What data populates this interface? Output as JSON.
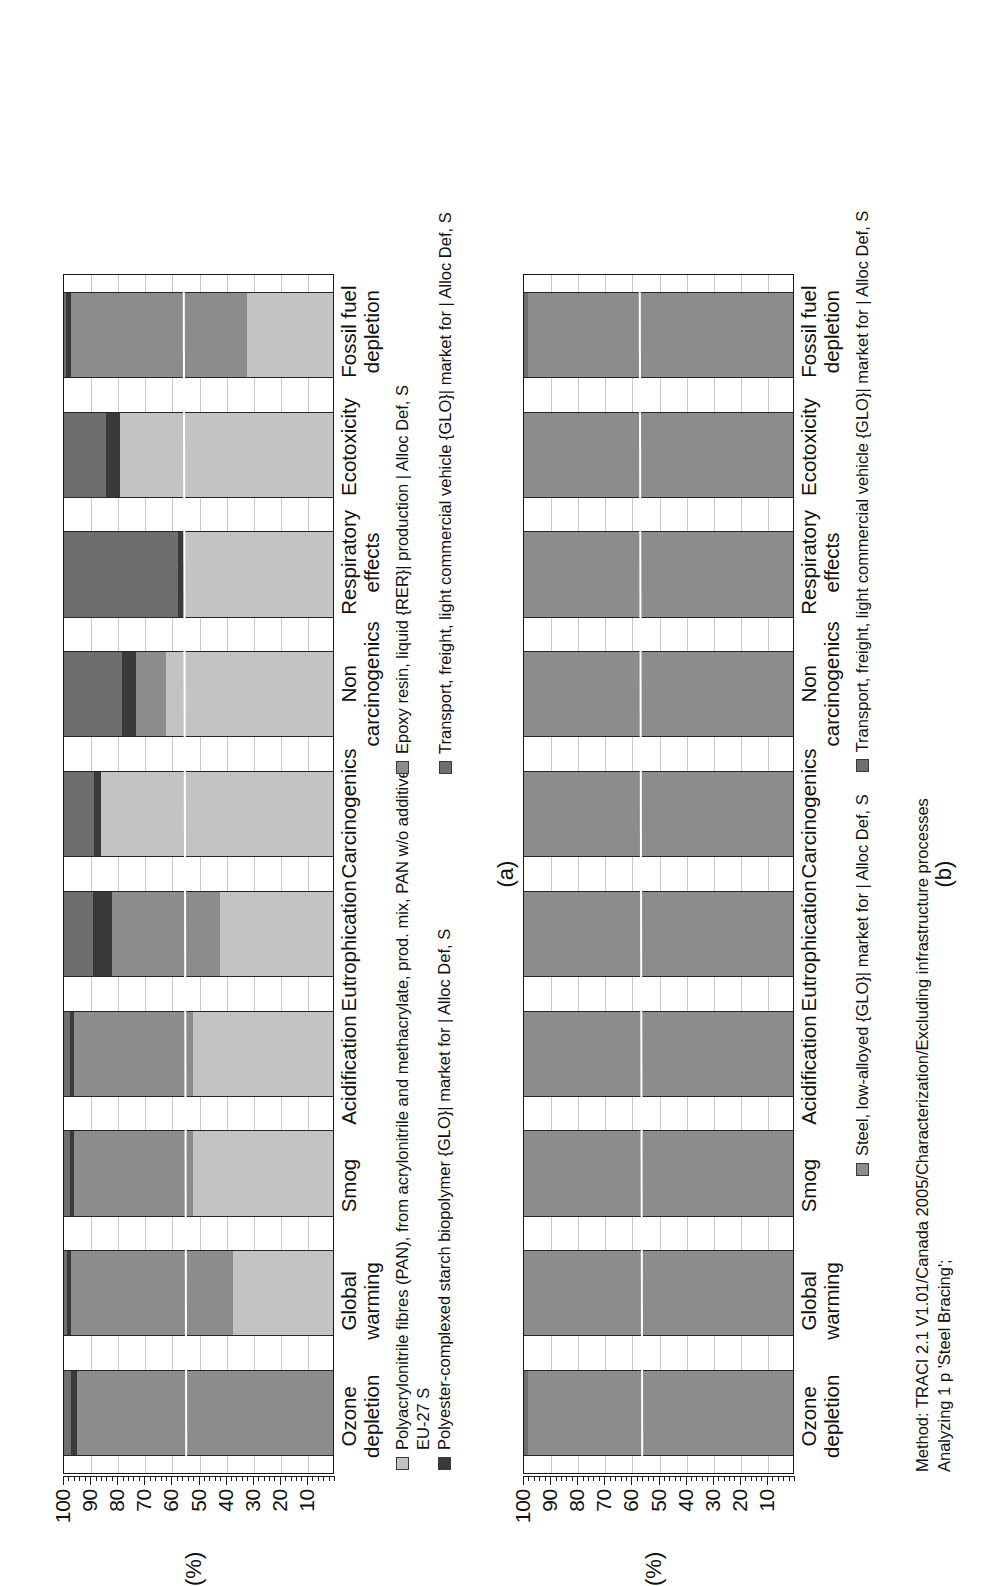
{
  "figure": {
    "axis_title": "(%)",
    "captions": {
      "a": "(a)",
      "b": "(b)"
    },
    "method_note": "Method: TRACI 2.1 V1.01/Canada 2005/Characterization/Excluding infrastructure processes\nAnalyzing 1 p 'Steel Bracing';"
  },
  "colors": {
    "light_gray": "#c3c3c3",
    "medium_gray": "#8c8c8c",
    "dark_gray": "#6e6e6e",
    "near_black": "#3a3a3a",
    "outline": "#262626",
    "grid": "#c9c9c9",
    "axis": "#1a1a1a"
  },
  "axis": {
    "ticks": [
      100,
      90,
      80,
      70,
      60,
      50,
      40,
      30,
      20,
      10
    ],
    "min": 0,
    "max": 100,
    "minor_per_major": 5
  },
  "chart_data": [
    {
      "id": "a",
      "type": "bar",
      "stacked": true,
      "orientation": "vertical",
      "title": "",
      "xlabel": "",
      "ylabel": "(%)",
      "ylim": [
        0,
        100
      ],
      "grid": true,
      "legend_position": "below",
      "categories": [
        "Ozone depletion",
        "Global warming",
        "Smog",
        "Acidification",
        "Eutrophication",
        "Carcinogenics",
        "Non carcinogenics",
        "Respiratory effects",
        "Ecotoxicity",
        "Fossil fuel depletion"
      ],
      "series": [
        {
          "name": "Polyacrylonitrile fibres (PAN), from acrylonitrile and methacrylate, prod. mix, PAN w/o additives EU-27 S",
          "color": "#c3c3c3",
          "values": [
            0,
            37,
            52,
            52,
            42,
            86,
            62,
            55,
            79,
            32
          ]
        },
        {
          "name": "Epoxy resin, liquid {RER}| production | Alloc Def, S",
          "color": "#8c8c8c",
          "values": [
            95,
            60,
            44,
            44,
            40,
            0,
            11,
            0,
            0,
            65
          ]
        },
        {
          "name": "Polyester-complexed starch biopolymer {GLO}| market for | Alloc Def, S",
          "color": "#3a3a3a",
          "values": [
            2,
            1.5,
            1.5,
            1.5,
            7,
            2.5,
            5,
            2.5,
            5,
            2
          ]
        },
        {
          "name": "Transport, freight, light commercial vehicle {GLO}| market for | Alloc Def, S",
          "color": "#6e6e6e",
          "values": [
            3,
            1.5,
            2.5,
            2.5,
            11,
            11.5,
            22,
            42.5,
            16,
            1
          ]
        }
      ]
    },
    {
      "id": "b",
      "type": "bar",
      "stacked": true,
      "orientation": "vertical",
      "title": "",
      "xlabel": "",
      "ylabel": "(%)",
      "ylim": [
        0,
        100
      ],
      "grid": true,
      "legend_position": "below",
      "categories": [
        "Ozone depletion",
        "Global warming",
        "Smog",
        "Acidification",
        "Eutrophication",
        "Carcinogenics",
        "Non carcinogenics",
        "Respiratory effects",
        "Ecotoxicity",
        "Fossil fuel depletion"
      ],
      "series": [
        {
          "name": "Steel, low-alloyed {GLO}| market for | Alloc Def, S",
          "color": "#8c8c8c",
          "values": [
            98,
            100,
            100,
            100,
            100,
            100,
            100,
            100,
            100,
            98
          ]
        },
        {
          "name": "Transport, freight, light commercial vehicle {GLO}| market for | Alloc Def, S",
          "color": "#6e6e6e",
          "values": [
            2,
            0,
            0,
            0,
            0,
            0,
            0,
            0,
            0,
            2
          ]
        }
      ]
    }
  ],
  "legend_a": {
    "col1": [
      "Polyacrylonitrile fibres (PAN), from acrylonitrile and methacrylate, prod. mix, PAN w/o additives",
      "EU-27 S",
      "Polyester-complexed starch biopolymer {GLO}| market for | Alloc Def, S"
    ],
    "col2": [
      "Epoxy resin, liquid {RER}| production | Alloc Def, S",
      "Transport, freight, light commercial vehicle {GLO}| market for | Alloc Def, S"
    ]
  },
  "legend_b": {
    "items": [
      "Steel, low-alloyed {GLO}| market for | Alloc Def, S",
      "Transport, freight, light commercial vehicle {GLO}| market for | Alloc Def, S"
    ]
  }
}
